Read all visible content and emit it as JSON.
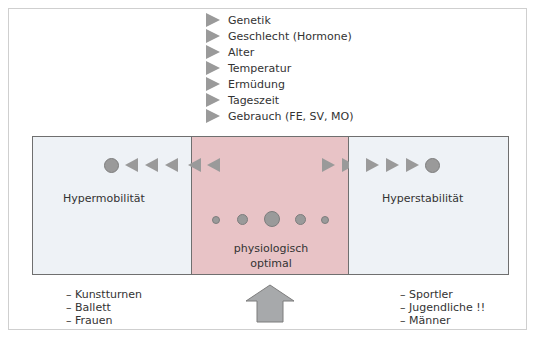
{
  "factors": {
    "title": "Einflussfaktoren",
    "items": [
      {
        "label": "Genetik",
        "icon": "triangle-right-icon"
      },
      {
        "label": "Geschlecht (Hormone)",
        "icon": "triangle-right-icon"
      },
      {
        "label": "Alter",
        "icon": "triangle-right-icon"
      },
      {
        "label": "Temperatur",
        "icon": "triangle-right-icon"
      },
      {
        "label": "Ermüdung",
        "icon": "triangle-right-icon"
      },
      {
        "label": "Tageszeit",
        "icon": "triangle-right-icon"
      },
      {
        "label": "Gebrauch (FE, SV, MO)",
        "icon": "triangle-right-icon"
      }
    ]
  },
  "zones": {
    "left": {
      "label": "Hypermobilität",
      "color": "#eef2f6"
    },
    "middle": {
      "label_line1": "physiologisch",
      "label_line2": "optimal",
      "color": "#e8c3c6"
    },
    "right": {
      "label": "Hyperstabilität",
      "color": "#eef2f6"
    }
  },
  "groups": {
    "left": [
      "– Kunstturnen",
      "– Ballett",
      "– Frauen"
    ],
    "right": [
      "– Sportler",
      "– Jugendliche !!",
      "– Männer"
    ]
  },
  "colors": {
    "marker": "#9a9a9a",
    "border": "#6f6f6f",
    "frame": "#cfcfcf"
  }
}
